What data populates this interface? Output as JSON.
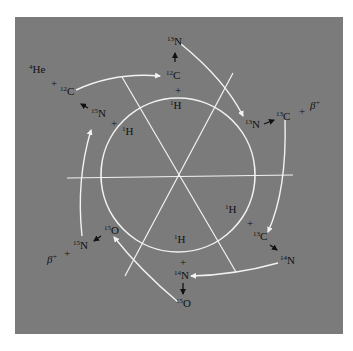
{
  "diagram": {
    "colors": {
      "background": "#ffffff",
      "panel": "#7b7b7b",
      "lines": "#f2f2f2",
      "text": "#111111"
    },
    "labels": {
      "he4": {
        "mass": "4",
        "symbol": "He"
      },
      "c12_left": {
        "mass": "12",
        "symbol": "C"
      },
      "n15_left": {
        "mass": "15",
        "symbol": "N"
      },
      "h1_topleft": {
        "mass": "1",
        "symbol": "H"
      },
      "n13_top": {
        "mass": "13",
        "symbol": "N"
      },
      "c12_top": {
        "mass": "12",
        "symbol": "C"
      },
      "h1_top": {
        "mass": "1",
        "symbol": "H"
      },
      "n13_right": {
        "mass": "13",
        "symbol": "N"
      },
      "c13_right": {
        "mass": "13",
        "symbol": "C"
      },
      "beta_right": {
        "symbol": "β",
        "charge": "+"
      },
      "h1_right": {
        "mass": "1",
        "symbol": "H"
      },
      "c13_bottomright": {
        "mass": "13",
        "symbol": "C"
      },
      "n14_right": {
        "mass": "14",
        "symbol": "N"
      },
      "h1_bottom": {
        "mass": "1",
        "symbol": "H"
      },
      "n14_bottom": {
        "mass": "14",
        "symbol": "N"
      },
      "o15_bottom": {
        "mass": "15",
        "symbol": "O"
      },
      "o15_left": {
        "mass": "15",
        "symbol": "O"
      },
      "n15_bottomleft": {
        "mass": "15",
        "symbol": "N"
      },
      "beta_left": {
        "symbol": "β",
        "charge": "+"
      }
    },
    "plus_sign": "+"
  }
}
